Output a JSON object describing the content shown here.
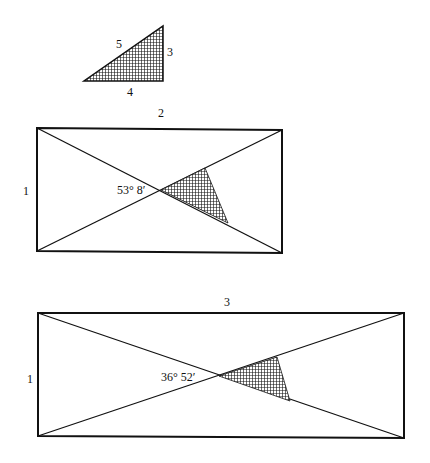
{
  "colors": {
    "stroke": "#111111",
    "hatch": "#111111",
    "background": "#ffffff"
  },
  "triangle": {
    "label_hypotenuse": "5",
    "label_vertical": "3",
    "label_base": "4"
  },
  "rect1": {
    "label_top": "2",
    "label_left": "1",
    "angle_label": "53° 8′"
  },
  "rect2": {
    "label_top": "3",
    "label_left": "1",
    "angle_label": "36° 52′"
  }
}
